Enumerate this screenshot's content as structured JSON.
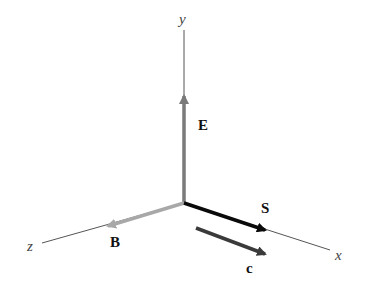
{
  "diagram": {
    "axes": {
      "x": {
        "label": "x"
      },
      "y": {
        "label": "y"
      },
      "z": {
        "label": "z"
      }
    },
    "vectors": {
      "E": {
        "label": "E",
        "direction": "+y",
        "color": "#7a7a7a"
      },
      "B": {
        "label": "B",
        "direction": "+z",
        "color": "#a8a8a8"
      },
      "S": {
        "label": "S",
        "direction": "+x",
        "color": "#0a0a0a"
      },
      "c": {
        "label": "c",
        "direction": "+x",
        "color": "#3a3a3a"
      }
    },
    "colors": {
      "axis": "#555555",
      "background": "#ffffff"
    }
  }
}
